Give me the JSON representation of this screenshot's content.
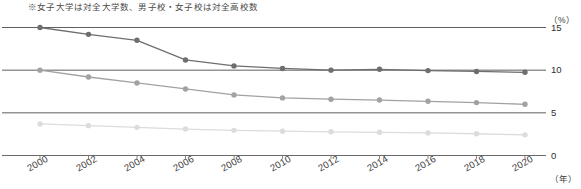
{
  "note": {
    "text": "※女子大学は対全大学数、男子校・女子校は対全高校数"
  },
  "axes": {
    "y_unit": "（%）",
    "x_unit": "（年）",
    "y_ticks": [
      "15",
      "10",
      "5",
      "0"
    ],
    "x_ticks": [
      "2000",
      "2002",
      "2004",
      "2006",
      "2008",
      "2010",
      "2012",
      "2014",
      "2016",
      "2018",
      "2020"
    ]
  },
  "colors": {
    "series_dark": "#6e6e6e",
    "series_medium": "#a2a2a2",
    "series_light": "#dcdcdc",
    "gridline": "#4d4d4d",
    "axis": "#6a6a6a",
    "text": "#333333"
  },
  "chart_data": {
    "type": "line",
    "title": "",
    "subtitle": "",
    "xlabel": "（年）",
    "ylabel": "（%）",
    "x": [
      2000,
      2002,
      2004,
      2006,
      2008,
      2010,
      2012,
      2014,
      2016,
      2018,
      2020
    ],
    "xlim": [
      2000,
      2020
    ],
    "ylim": [
      0,
      15
    ],
    "yticks": [
      0,
      5,
      10,
      15
    ],
    "grid": true,
    "legend": "none",
    "annotations": [
      "※女子大学は対全大学数、男子校・女子校は対全高校数"
    ],
    "series": [
      {
        "name": "series-dark",
        "color": "#6e6e6e",
        "values": [
          15.0,
          14.2,
          13.5,
          11.2,
          10.5,
          10.2,
          10.0,
          10.1,
          9.95,
          9.85,
          9.75
        ]
      },
      {
        "name": "series-medium",
        "color": "#a2a2a2",
        "values": [
          10.0,
          9.2,
          8.5,
          7.8,
          7.1,
          6.75,
          6.6,
          6.5,
          6.35,
          6.2,
          6.0
        ]
      },
      {
        "name": "series-light",
        "color": "#dcdcdc",
        "values": [
          3.7,
          3.5,
          3.3,
          3.1,
          2.95,
          2.85,
          2.78,
          2.72,
          2.65,
          2.55,
          2.42
        ]
      }
    ]
  }
}
